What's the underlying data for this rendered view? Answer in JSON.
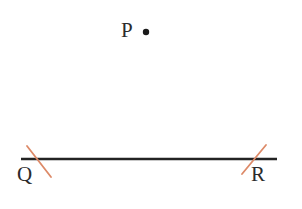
{
  "figure": {
    "type": "geometric-construction",
    "background_color": "#ffffff",
    "width": 302,
    "height": 209,
    "labels": {
      "p": "P",
      "q": "Q",
      "r": "R"
    },
    "label_color": "#2b2b2b",
    "points": [
      {
        "name": "P",
        "label": "P",
        "x": 146,
        "y": 32,
        "marker": "filled-dot",
        "radius": 3.2,
        "color": "#1a1a1a",
        "label_x": 121,
        "label_y": 20
      },
      {
        "name": "Q",
        "label": "Q",
        "x": 38,
        "y": 159,
        "marker": "tick-mark",
        "label_x": 17,
        "label_y": 164
      },
      {
        "name": "R",
        "label": "R",
        "x": 254,
        "y": 159,
        "marker": "tick-mark",
        "label_x": 251,
        "label_y": 164
      }
    ],
    "segment": {
      "name": "QR",
      "x1": 21,
      "y1": 159,
      "x2": 277,
      "y2": 159,
      "color": "#232323",
      "stroke_width": 2.6
    },
    "tick_marks": [
      {
        "name": "tick-q",
        "at_point": "Q",
        "x1": 27,
        "y1": 146,
        "x2": 51,
        "y2": 177,
        "color": "#dd8a68",
        "stroke_width": 1.8,
        "direction": "down-right"
      },
      {
        "name": "tick-r",
        "at_point": "R",
        "x1": 242,
        "y1": 174,
        "x2": 266,
        "y2": 145,
        "color": "#dd8a68",
        "stroke_width": 1.8,
        "direction": "up-right"
      }
    ]
  }
}
